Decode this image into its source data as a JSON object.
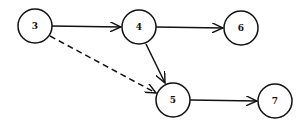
{
  "diagram": {
    "type": "network-graph",
    "nodes": [
      {
        "id": "3",
        "label": "3",
        "x": 35,
        "y": 26
      },
      {
        "id": "4",
        "label": "4",
        "x": 139,
        "y": 27
      },
      {
        "id": "6",
        "label": "6",
        "x": 241,
        "y": 28
      },
      {
        "id": "5",
        "label": "5",
        "x": 173,
        "y": 100
      },
      {
        "id": "7",
        "label": "7",
        "x": 275,
        "y": 101
      }
    ],
    "edges": [
      {
        "from": "3",
        "to": "4",
        "style": "solid"
      },
      {
        "from": "4",
        "to": "6",
        "style": "solid"
      },
      {
        "from": "4",
        "to": "5",
        "style": "solid"
      },
      {
        "from": "3",
        "to": "5",
        "style": "dashed"
      },
      {
        "from": "5",
        "to": "7",
        "style": "solid"
      }
    ]
  }
}
